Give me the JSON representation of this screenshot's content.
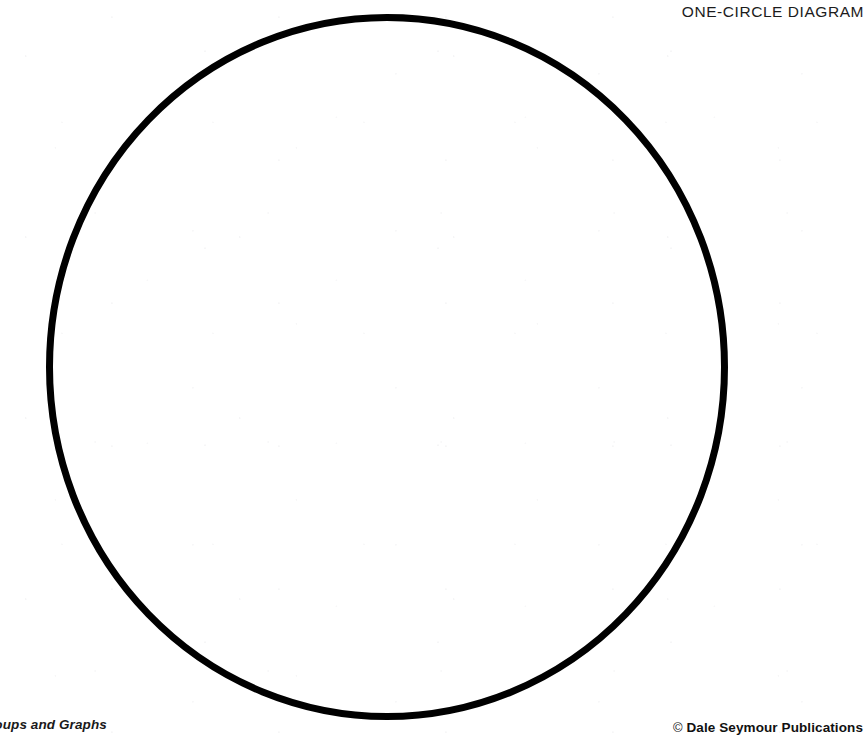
{
  "page": {
    "width": 866,
    "height": 743,
    "background_color": "#ffffff",
    "ink_color": "#000000"
  },
  "header": {
    "title": "ONE-CIRCLE DIAGRAM"
  },
  "diagram": {
    "name": "one-circle-venn-diagram",
    "shape_label": "circle",
    "shape_count": 1,
    "stroke_color": "#000000",
    "stroke_width": 7,
    "fill": "none",
    "center_x": 387,
    "center_y": 367,
    "radius_x": 341,
    "radius_y": 353,
    "bounds": {
      "left": 46,
      "top": 14,
      "right": 728,
      "bottom": 720
    }
  },
  "footer": {
    "left_text": "roups and Graphs",
    "left_text_note": "clipped at left page edge",
    "copyright_mark": "©",
    "right_text": "Dale Seymour Publications"
  }
}
